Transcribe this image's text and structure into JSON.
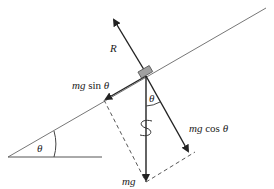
{
  "diagram": {
    "type": "free-body diagram on inclined plane",
    "labels": {
      "normal_force": "R",
      "weight": "mg",
      "parallel_component_mg": "mg",
      "parallel_component_fn": "sin",
      "parallel_component_angle": "θ",
      "perpendicular_component_mg": "mg",
      "perpendicular_component_fn": "cos",
      "perpendicular_component_angle": "θ",
      "incline_angle": "θ",
      "block_angle": "θ"
    },
    "colors": {
      "line": "#222222",
      "incline": "#777777",
      "block_fill": "#a0a0a0",
      "dashed": "#444444"
    },
    "forces": [
      {
        "name": "R",
        "direction": "perpendicular to incline, away from surface"
      },
      {
        "name": "mg",
        "direction": "vertically downward"
      },
      {
        "name": "mg sin θ",
        "direction": "down the slope"
      },
      {
        "name": "mg cos θ",
        "direction": "into the slope, perpendicular"
      }
    ],
    "annotations": {
      "spring_symbol": "S",
      "dashed_lines": "component resolution parallelogram"
    }
  }
}
